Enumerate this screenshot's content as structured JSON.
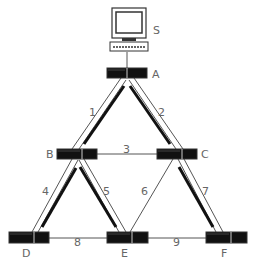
{
  "diagram": {
    "server": {
      "label": "S"
    },
    "nodes": [
      {
        "id": "A",
        "label": "A"
      },
      {
        "id": "B",
        "label": "B"
      },
      {
        "id": "C",
        "label": "C"
      },
      {
        "id": "D",
        "label": "D"
      },
      {
        "id": "E",
        "label": "E"
      },
      {
        "id": "F",
        "label": "F"
      }
    ],
    "links": [
      {
        "id": "1",
        "label": "1",
        "from": "A",
        "to": "B",
        "active": true
      },
      {
        "id": "2",
        "label": "2",
        "from": "A",
        "to": "C",
        "active": true
      },
      {
        "id": "3",
        "label": "3",
        "from": "B",
        "to": "C",
        "active": false
      },
      {
        "id": "4",
        "label": "4",
        "from": "B",
        "to": "D",
        "active": true
      },
      {
        "id": "5",
        "label": "5",
        "from": "B",
        "to": "E",
        "active": true
      },
      {
        "id": "6",
        "label": "6",
        "from": "C",
        "to": "E",
        "active": false
      },
      {
        "id": "7",
        "label": "7",
        "from": "C",
        "to": "F",
        "active": true
      },
      {
        "id": "8",
        "label": "8",
        "from": "D",
        "to": "E",
        "active": false
      },
      {
        "id": "9",
        "label": "9",
        "from": "E",
        "to": "F",
        "active": false
      }
    ]
  }
}
